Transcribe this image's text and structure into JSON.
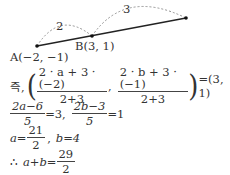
{
  "diagram": {
    "point_a_label": "A(−2, −1)",
    "point_b_label": "B(3, 1)",
    "arc_ab_label": "2",
    "arc_bc_label": "3"
  },
  "solution": {
    "line1": {
      "prefix": "즉,",
      "frac1_num": "2 · a + 3 · (−2)",
      "frac1_den": "2+3",
      "sep": ",",
      "frac2_num": "2 · b + 3 · (−1)",
      "frac2_den": "2+3",
      "result": "=(3, 1)"
    },
    "line2": {
      "frac1_num": "2a−6",
      "frac1_den": "5",
      "eq1": "=3,",
      "frac2_num": "2b−3",
      "frac2_den": "5",
      "eq2": "=1"
    },
    "line3": {
      "a_lhs": "a=",
      "a_num": "21",
      "a_den": "2",
      "sep": ",",
      "b_expr": "b=4"
    },
    "line4": {
      "therefore": "∴",
      "lhs": "a+b=",
      "num": "29",
      "den": "2"
    }
  }
}
